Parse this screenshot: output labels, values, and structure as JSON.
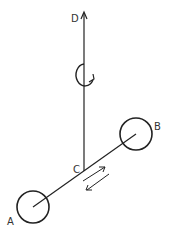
{
  "diagram": {
    "labels": {
      "D": "D",
      "C": "C",
      "B": "B",
      "A": "A"
    },
    "elements": [
      {
        "id": "axis-D",
        "type": "vertical-arrow",
        "from": [
          84,
          170
        ],
        "to": [
          84,
          12
        ]
      },
      {
        "id": "rotation",
        "type": "rotation-arrow",
        "center": [
          82,
          76
        ]
      },
      {
        "id": "rod-AB",
        "type": "line",
        "from": "A",
        "to": "B",
        "through": "C"
      },
      {
        "id": "mass-A",
        "type": "circle",
        "label": "A"
      },
      {
        "id": "mass-B",
        "type": "circle",
        "label": "B"
      },
      {
        "id": "sliding-arrows",
        "type": "double-arrow",
        "direction": "along rod"
      }
    ]
  }
}
